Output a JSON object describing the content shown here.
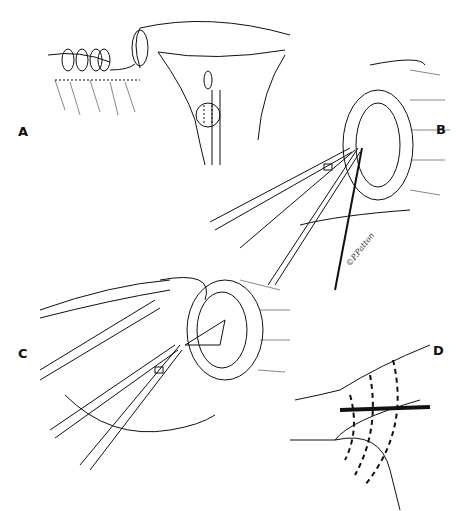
{
  "figure": {
    "type": "surgical line illustration",
    "background": "#ffffff",
    "ink_color": "#111111",
    "panels": [
      {
        "id": "A",
        "label": "A",
        "description": "uterus with rolled tissue and ovoid structure at cervix"
      },
      {
        "id": "B",
        "label": "B",
        "description": "forceps grasping tissue inside circular opening with suture"
      },
      {
        "id": "C",
        "label": "C",
        "description": "retractor blade and forceps pulling tissue from circular opening"
      },
      {
        "id": "D",
        "label": "D",
        "description": "tubular structure with dashed incision lines"
      }
    ],
    "signature": "©P.Patton"
  }
}
